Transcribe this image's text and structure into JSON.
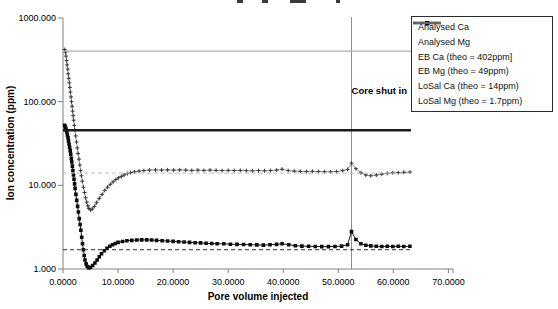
{
  "chart_data": {
    "type": "line",
    "title_cropped_at_top": true,
    "xlabel": "Pore volume injected",
    "ylabel": "Ion concentration (ppm)",
    "x_axis": {
      "min": 0,
      "max": 70,
      "tick_values": [
        0,
        10,
        20,
        30,
        40,
        50,
        60,
        70
      ],
      "tick_labels": [
        "0.0000",
        "10.0000",
        "20.0000",
        "30.0000",
        "40.0000",
        "50.0000",
        "60.0000",
        "70.0000"
      ]
    },
    "y_axis": {
      "scale": "log",
      "min": 1,
      "max": 1000,
      "tick_values": [
        1,
        10,
        100,
        1000
      ],
      "tick_labels": [
        "1.000",
        "10.000",
        "100.000",
        "1000.000"
      ]
    },
    "grid": "off",
    "legend_position": "top-right",
    "annotation": {
      "label": "Core shut in",
      "x": 52.4,
      "line_color": "#8c8c8c"
    },
    "axis_color": "#808080",
    "series": [
      {
        "name": "Analysed Ca",
        "kind": "line-marker",
        "plot_marker": "plus",
        "legend_marker": "circle",
        "color": "#383838",
        "line_color": "#8a8a8a",
        "line_width": 0.9,
        "points": [
          [
            0.3,
            420
          ],
          [
            0.45,
            390
          ],
          [
            0.55,
            350
          ],
          [
            0.65,
            310
          ],
          [
            0.75,
            275
          ],
          [
            0.85,
            245
          ],
          [
            0.95,
            215
          ],
          [
            1.05,
            190
          ],
          [
            1.15,
            168
          ],
          [
            1.25,
            148
          ],
          [
            1.35,
            130
          ],
          [
            1.45,
            114
          ],
          [
            1.55,
            100
          ],
          [
            1.65,
            88
          ],
          [
            1.75,
            77
          ],
          [
            1.85,
            68
          ],
          [
            1.95,
            60
          ],
          [
            2.05,
            52
          ],
          [
            2.15,
            46
          ],
          [
            2.3,
            39
          ],
          [
            2.45,
            33
          ],
          [
            2.6,
            28
          ],
          [
            2.75,
            24
          ],
          [
            2.9,
            20.5
          ],
          [
            3.05,
            17.5
          ],
          [
            3.2,
            15
          ],
          [
            3.35,
            13
          ],
          [
            3.5,
            11.2
          ],
          [
            3.7,
            9.5
          ],
          [
            3.9,
            8.2
          ],
          [
            4.1,
            7.1
          ],
          [
            4.3,
            6.3
          ],
          [
            4.5,
            5.7
          ],
          [
            4.7,
            5.3
          ],
          [
            5.0,
            5.1
          ],
          [
            5.3,
            5.2
          ],
          [
            5.7,
            5.6
          ],
          [
            6.1,
            6.2
          ],
          [
            6.6,
            7.0
          ],
          [
            7.1,
            7.8
          ],
          [
            7.6,
            8.7
          ],
          [
            8.1,
            9.5
          ],
          [
            8.6,
            10.3
          ],
          [
            9.1,
            11.0
          ],
          [
            9.6,
            11.7
          ],
          [
            10.1,
            12.3
          ],
          [
            10.6,
            12.8
          ],
          [
            11.1,
            13.3
          ],
          [
            11.7,
            13.8
          ],
          [
            12.3,
            14.2
          ],
          [
            13.0,
            14.5
          ],
          [
            13.8,
            14.8
          ],
          [
            14.7,
            15.0
          ],
          [
            15.7,
            15.2
          ],
          [
            16.8,
            15.3
          ],
          [
            17.9,
            15.2
          ],
          [
            19.0,
            15.3
          ],
          [
            20.1,
            15.2
          ],
          [
            21.2,
            15.3
          ],
          [
            22.3,
            15.2
          ],
          [
            23.4,
            15.1
          ],
          [
            24.5,
            15.2
          ],
          [
            25.6,
            15.1
          ],
          [
            26.7,
            15.2
          ],
          [
            27.8,
            15.1
          ],
          [
            28.9,
            15.0
          ],
          [
            30.0,
            15.1
          ],
          [
            31.1,
            15.0
          ],
          [
            32.2,
            15.1
          ],
          [
            33.3,
            15.0
          ],
          [
            34.4,
            14.9
          ],
          [
            35.5,
            15.0
          ],
          [
            36.6,
            14.9
          ],
          [
            37.7,
            15.0
          ],
          [
            38.8,
            15.2
          ],
          [
            39.8,
            15.6
          ],
          [
            40.9,
            15.0
          ],
          [
            42.0,
            14.8
          ],
          [
            43.1,
            14.7
          ],
          [
            44.2,
            14.6
          ],
          [
            45.3,
            14.7
          ],
          [
            46.4,
            14.6
          ],
          [
            47.5,
            14.5
          ],
          [
            48.6,
            14.5
          ],
          [
            49.7,
            14.6
          ],
          [
            50.8,
            15.0
          ],
          [
            51.7,
            15.5
          ],
          [
            52.4,
            18.5
          ],
          [
            53.2,
            15.8
          ],
          [
            54.1,
            14.1
          ],
          [
            55.0,
            13.3
          ],
          [
            55.9,
            13.0
          ],
          [
            56.9,
            13.3
          ],
          [
            57.9,
            13.6
          ],
          [
            58.9,
            13.9
          ],
          [
            59.9,
            14.1
          ],
          [
            60.9,
            14.2
          ],
          [
            61.9,
            14.3
          ],
          [
            63.0,
            14.4
          ]
        ]
      },
      {
        "name": "Analysed Mg",
        "kind": "line-marker",
        "plot_marker": "square",
        "legend_marker": "square",
        "color": "#0d0d0d",
        "line_color": "#1a1a1a",
        "line_width": 1,
        "points": [
          [
            0.3,
            52
          ],
          [
            0.4,
            50
          ],
          [
            0.5,
            48
          ],
          [
            0.6,
            45.5
          ],
          [
            0.7,
            43
          ],
          [
            0.8,
            40
          ],
          [
            0.9,
            37
          ],
          [
            1.0,
            34
          ],
          [
            1.1,
            31
          ],
          [
            1.2,
            28.5
          ],
          [
            1.3,
            26
          ],
          [
            1.4,
            23.5
          ],
          [
            1.5,
            21
          ],
          [
            1.6,
            19
          ],
          [
            1.7,
            17
          ],
          [
            1.8,
            15
          ],
          [
            1.9,
            13.3
          ],
          [
            2.0,
            11.8
          ],
          [
            2.1,
            10.4
          ],
          [
            2.2,
            9.2
          ],
          [
            2.35,
            7.8
          ],
          [
            2.5,
            6.6
          ],
          [
            2.65,
            5.6
          ],
          [
            2.8,
            4.8
          ],
          [
            2.95,
            4.0
          ],
          [
            3.1,
            3.4
          ],
          [
            3.25,
            2.9
          ],
          [
            3.4,
            2.4
          ],
          [
            3.55,
            2.0
          ],
          [
            3.7,
            1.7
          ],
          [
            3.85,
            1.45
          ],
          [
            4.0,
            1.28
          ],
          [
            4.2,
            1.15
          ],
          [
            4.4,
            1.07
          ],
          [
            4.7,
            1.03
          ],
          [
            5.0,
            1.05
          ],
          [
            5.4,
            1.1
          ],
          [
            5.8,
            1.18
          ],
          [
            6.2,
            1.28
          ],
          [
            6.6,
            1.4
          ],
          [
            7.0,
            1.52
          ],
          [
            7.5,
            1.65
          ],
          [
            8.0,
            1.77
          ],
          [
            8.5,
            1.87
          ],
          [
            9.0,
            1.95
          ],
          [
            9.5,
            2.02
          ],
          [
            10.0,
            2.08
          ],
          [
            10.8,
            2.13
          ],
          [
            11.6,
            2.18
          ],
          [
            12.5,
            2.2
          ],
          [
            13.4,
            2.22
          ],
          [
            14.3,
            2.23
          ],
          [
            15.2,
            2.23
          ],
          [
            16.1,
            2.22
          ],
          [
            17.0,
            2.2
          ],
          [
            18.0,
            2.18
          ],
          [
            19.0,
            2.16
          ],
          [
            20.0,
            2.14
          ],
          [
            21.0,
            2.12
          ],
          [
            22.0,
            2.1
          ],
          [
            23.0,
            2.08
          ],
          [
            24.0,
            2.06
          ],
          [
            25.0,
            2.05
          ],
          [
            26.0,
            2.03
          ],
          [
            27.0,
            2.02
          ],
          [
            28.0,
            2.0
          ],
          [
            29.2,
            2.0
          ],
          [
            30.4,
            1.98
          ],
          [
            31.6,
            1.97
          ],
          [
            32.8,
            1.96
          ],
          [
            34.0,
            1.95
          ],
          [
            35.2,
            1.94
          ],
          [
            36.4,
            1.93
          ],
          [
            37.6,
            1.95
          ],
          [
            38.8,
            1.97
          ],
          [
            39.8,
            2.0
          ],
          [
            41.0,
            1.95
          ],
          [
            42.2,
            1.9
          ],
          [
            43.4,
            1.88
          ],
          [
            44.6,
            1.87
          ],
          [
            45.8,
            1.86
          ],
          [
            47.0,
            1.85
          ],
          [
            48.2,
            1.85
          ],
          [
            49.4,
            1.86
          ],
          [
            50.6,
            1.88
          ],
          [
            51.7,
            1.95
          ],
          [
            52.4,
            2.8
          ],
          [
            53.2,
            2.25
          ],
          [
            54.1,
            2.0
          ],
          [
            55.0,
            1.92
          ],
          [
            55.9,
            1.89
          ],
          [
            56.9,
            1.87
          ],
          [
            57.9,
            1.86
          ],
          [
            58.9,
            1.87
          ],
          [
            59.9,
            1.86
          ],
          [
            60.9,
            1.87
          ],
          [
            61.9,
            1.86
          ],
          [
            63.0,
            1.87
          ]
        ]
      },
      {
        "name": "EB Ca (theo = 402ppm]",
        "kind": "hline",
        "value": 45.5,
        "t_start": 0,
        "t_end": 63.2,
        "color": "#1a1a1a",
        "line_width": 2.6
      },
      {
        "name": "EB Mg (theo = 49ppm)",
        "kind": "hline",
        "value": 402,
        "t_start": 0,
        "t_end": 70.8,
        "color": "#ababab",
        "line_width": 1.2
      },
      {
        "name": "LoSal Ca (theo = 14ppm)",
        "kind": "hline",
        "value": 14,
        "t_start": 0,
        "t_end": 63.4,
        "color": "#bdbdbd",
        "line_width": 1,
        "dash": "4,3"
      },
      {
        "name": "LoSal Mg (theo = 1.7ppm)",
        "kind": "hline",
        "value": 1.7,
        "t_start": 0,
        "t_end": 63.4,
        "color": "#2e2e2e",
        "line_width": 1,
        "dash": "4,3"
      }
    ]
  }
}
